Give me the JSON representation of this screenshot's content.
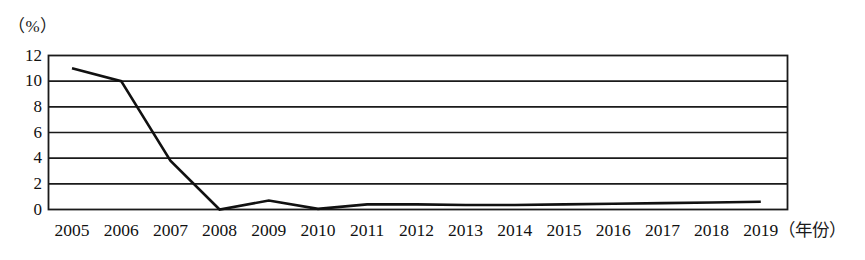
{
  "chart_data": {
    "type": "line",
    "title": "",
    "subtitle": "",
    "xlabel": "（年份）",
    "ylabel": "（%）",
    "ylim": [
      0,
      12
    ],
    "ytick_values": [
      0,
      2,
      4,
      6,
      8,
      10,
      12
    ],
    "ytick_labels": [
      "0",
      "2",
      "4",
      "6",
      "8",
      "10",
      "12"
    ],
    "grid": "horizontal",
    "legend": "none",
    "categories": [
      "2005",
      "2006",
      "2007",
      "2008",
      "2009",
      "2010",
      "2011",
      "2012",
      "2013",
      "2014",
      "2015",
      "2016",
      "2017",
      "2018",
      "2019"
    ],
    "x": [
      2005,
      2006,
      2007,
      2008,
      2009,
      2010,
      2011,
      2012,
      2013,
      2014,
      2015,
      2016,
      2017,
      2018,
      2019
    ],
    "values": [
      11.0,
      10.0,
      3.8,
      0.0,
      0.7,
      0.05,
      0.4,
      0.4,
      0.35,
      0.35,
      0.4,
      0.45,
      0.5,
      0.55,
      0.6
    ],
    "series": [
      {
        "name": "",
        "values": [
          11.0,
          10.0,
          3.8,
          0.0,
          0.7,
          0.05,
          0.4,
          0.4,
          0.35,
          0.35,
          0.4,
          0.45,
          0.5,
          0.55,
          0.6
        ]
      }
    ],
    "line_color": "#111111",
    "grid_color": "#1a1a1a",
    "background_color": "#ffffff"
  },
  "axes": {
    "unit_label": "（%）",
    "x_unit_label": "（年份）"
  }
}
